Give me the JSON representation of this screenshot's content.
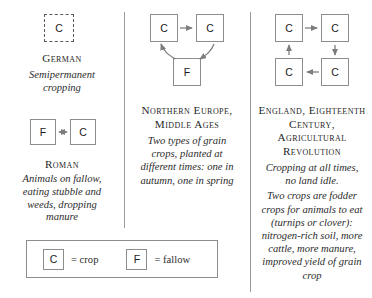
{
  "figure": {
    "line_color": "#8d8d8d",
    "text_color": "#2b2b2b"
  },
  "columns": [
    {
      "id": "german",
      "heading": "German",
      "caption": "Semipermanent cropping",
      "diagram": {
        "type": "cycle",
        "nodes": [
          {
            "id": "german-c",
            "label": "C",
            "style": "dashed"
          }
        ],
        "arrows": []
      }
    },
    {
      "id": "roman",
      "heading": "Roman",
      "caption": "Animals on fallow, eating stubble and weeds, dropping manure",
      "diagram": {
        "type": "two-node",
        "nodes": [
          {
            "id": "roman-f",
            "label": "F",
            "style": "solid"
          },
          {
            "id": "roman-c",
            "label": "C",
            "style": "solid"
          }
        ],
        "arrows": [
          {
            "from": "roman-f",
            "to": "roman-c",
            "heads": "double"
          }
        ]
      }
    },
    {
      "id": "northern-europe",
      "heading": "Northern Europe, Middle Ages",
      "caption": "Two types of grain crops, planted at different times: one in autumn, one in spring",
      "diagram": {
        "type": "three-node-cycle",
        "nodes": [
          {
            "id": "ne-c1",
            "label": "C",
            "style": "solid"
          },
          {
            "id": "ne-c2",
            "label": "C",
            "style": "solid"
          },
          {
            "id": "ne-f",
            "label": "F",
            "style": "solid"
          }
        ],
        "arrows": [
          {
            "from": "ne-c1",
            "to": "ne-c2",
            "heads": "single"
          },
          {
            "from": "ne-c2",
            "to": "ne-f",
            "heads": "single"
          },
          {
            "from": "ne-f",
            "to": "ne-c1",
            "heads": "single"
          }
        ]
      }
    },
    {
      "id": "england",
      "heading": "England, Eighteenth Century, Agricultural Revolution",
      "caption_1": "Cropping at all times, no land idle.",
      "caption_2": "Two crops are fodder crops for animals to eat (turnips or clover): nitrogen-rich soil, more cattle, more manure, improved yield of grain crop",
      "diagram": {
        "type": "four-node-cycle",
        "nodes": [
          {
            "id": "en-c-tl",
            "label": "C",
            "style": "solid"
          },
          {
            "id": "en-c-tr",
            "label": "C",
            "style": "solid"
          },
          {
            "id": "en-c-br",
            "label": "C",
            "style": "solid"
          },
          {
            "id": "en-c-bl",
            "label": "C",
            "style": "solid"
          }
        ],
        "arrows": [
          {
            "from": "en-c-tl",
            "to": "en-c-tr",
            "heads": "single"
          },
          {
            "from": "en-c-tr",
            "to": "en-c-br",
            "heads": "single"
          },
          {
            "from": "en-c-br",
            "to": "en-c-bl",
            "heads": "single"
          },
          {
            "from": "en-c-bl",
            "to": "en-c-tl",
            "heads": "single"
          }
        ]
      }
    }
  ],
  "legend": {
    "crop": {
      "symbol": "C",
      "text": "= crop"
    },
    "fallow": {
      "symbol": "F",
      "text": "= fallow"
    }
  }
}
